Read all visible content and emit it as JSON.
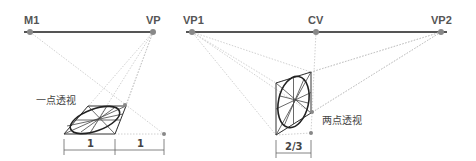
{
  "left_diagram": {
    "title": "一点透视",
    "points": [
      {
        "label": "M1",
        "x": 30,
        "y": 32
      },
      {
        "label": "VP",
        "x": 153,
        "y": 32
      }
    ],
    "dimension_labels": [
      "1",
      "1"
    ]
  },
  "right_diagram": {
    "title": "两点透视",
    "points": [
      {
        "label": "VP1",
        "x": 192,
        "y": 32
      },
      {
        "label": "CV",
        "x": 316,
        "y": 32
      },
      {
        "label": "VP2",
        "x": 441,
        "y": 32
      }
    ],
    "dimension_labels": [
      "2/3"
    ]
  },
  "colors": {
    "horizon": "#555555",
    "dot": "#888888",
    "guide": "#bbbbbb",
    "shape": "#333333",
    "ellipse": "#222222"
  }
}
